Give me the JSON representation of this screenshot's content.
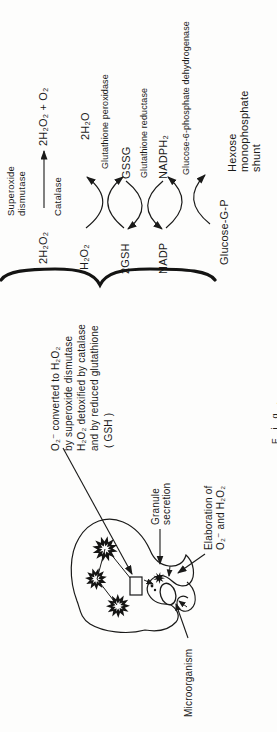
{
  "pathway": {
    "row1": {
      "substrate": "2H₂O₂",
      "product": "2H₂O₂ + O₂",
      "enzyme_above_line1": "Superoxide",
      "enzyme_above_line2": "dismutase",
      "enzyme_below": "Catalase"
    },
    "row2": {
      "left": "H₂O₂",
      "right": "2H₂O"
    },
    "row3": {
      "left": "2GSH",
      "right": "GSSG"
    },
    "row4": {
      "left": "NADP",
      "right": "NADPH₂"
    },
    "row5": {
      "left": "Glucose-G-P",
      "right_line1": "Hexose",
      "right_line2": "monophosphate",
      "right_line3": "shunt"
    },
    "enzymes": {
      "peroxidase": "Glutathione peroxidase",
      "reductase": "Glutathione reductase",
      "g6pd": "Glucose-6-phosphate dehydrogenase"
    }
  },
  "note": {
    "line1": "O₂⁻ converted to H₂O₂",
    "line2": "by superoxide dismutase",
    "line3": "H₂O₂ detoxified by catalase",
    "line4": "and by reduced glutathione",
    "line5": "( GSH )"
  },
  "cell": {
    "granule_label_line1": "Granule",
    "granule_label_line2": "secretion",
    "elaboration_line1": "Elaboration of",
    "elaboration_line2": "O₂⁻ and H₂O₂",
    "microorganism_label": "Microorganism"
  },
  "caption_fragment": "Fig.",
  "colors": {
    "ink": "#1a1a19",
    "background": "#fdfdfc"
  }
}
